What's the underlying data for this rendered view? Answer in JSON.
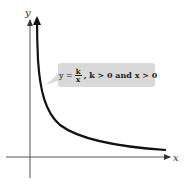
{
  "diagram": {
    "type": "function-graph",
    "axes": {
      "x_label": "x",
      "y_label": "y"
    },
    "curve": {
      "description": "hyperbola branch in first quadrant",
      "color": "#111111"
    },
    "callout": {
      "lhs": "y =",
      "numerator": "k",
      "denominator": "x",
      "conditions": ", k > 0 and x > 0",
      "background": "#d9d9d9"
    }
  }
}
